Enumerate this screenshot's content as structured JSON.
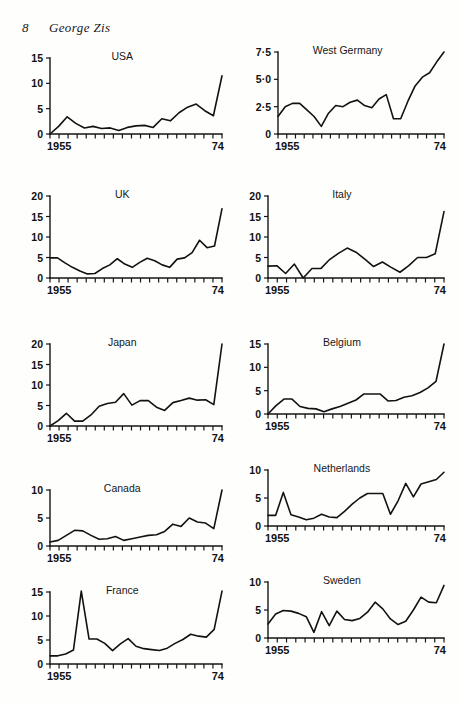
{
  "page": {
    "folio": "8",
    "running_head": "George Zis",
    "background_color": "#fefefd",
    "ink_color": "#121212"
  },
  "chart_data": [
    {
      "id": "usa",
      "type": "line",
      "title": "USA",
      "xlabel": "",
      "ylabel": "",
      "x_start_label": "1955",
      "x_end_label": "74",
      "x": [
        1955,
        1956,
        1957,
        1958,
        1959,
        1960,
        1961,
        1962,
        1963,
        1964,
        1965,
        1966,
        1967,
        1968,
        1969,
        1970,
        1971,
        1972,
        1973,
        1974
      ],
      "xlim": [
        1955,
        1974
      ],
      "ylim": [
        0,
        15
      ],
      "yticks": [
        0,
        5,
        10,
        15
      ],
      "ytick_labels": [
        "0",
        "5",
        "10",
        "15"
      ],
      "grid": false,
      "values": [
        0.0,
        1.5,
        3.4,
        2.1,
        1.2,
        1.5,
        1.1,
        1.2,
        0.7,
        1.3,
        1.6,
        1.7,
        1.3,
        3.0,
        2.6,
        4.2,
        5.3,
        5.9,
        4.6,
        3.6,
        11.5
      ]
    },
    {
      "id": "west-germany",
      "type": "line",
      "title": "West Germany",
      "xlabel": "",
      "ylabel": "",
      "x_start_label": "1955",
      "x_end_label": "74",
      "x": [
        1955,
        1956,
        1957,
        1958,
        1959,
        1960,
        1961,
        1962,
        1963,
        1964,
        1965,
        1966,
        1967,
        1968,
        1969,
        1970,
        1971,
        1972,
        1973,
        1974
      ],
      "xlim": [
        1955,
        1974
      ],
      "ylim": [
        0,
        7.5
      ],
      "yticks": [
        0,
        2.5,
        5.0,
        7.5
      ],
      "ytick_labels": [
        "0",
        "2·5",
        "5·0",
        "7·5"
      ],
      "grid": false,
      "values": [
        1.6,
        2.5,
        2.8,
        2.8,
        2.2,
        1.6,
        0.7,
        1.9,
        2.6,
        2.5,
        2.9,
        3.1,
        2.6,
        2.4,
        3.2,
        3.6,
        1.4,
        1.4,
        3.0,
        4.4,
        5.2,
        5.6,
        6.6,
        7.5
      ]
    },
    {
      "id": "uk",
      "type": "line",
      "title": "UK",
      "xlabel": "",
      "ylabel": "",
      "x_start_label": "1955",
      "x_end_label": "74",
      "x": [
        1955,
        1956,
        1957,
        1958,
        1959,
        1960,
        1961,
        1962,
        1963,
        1964,
        1965,
        1966,
        1967,
        1968,
        1969,
        1970,
        1971,
        1972,
        1973,
        1974
      ],
      "xlim": [
        1955,
        1974
      ],
      "ylim": [
        0,
        20
      ],
      "yticks": [
        0,
        5,
        10,
        15,
        20
      ],
      "ytick_labels": [
        "0",
        "5",
        "10",
        "15",
        "20"
      ],
      "grid": false,
      "values": [
        4.9,
        4.9,
        3.7,
        2.6,
        1.7,
        1.0,
        1.1,
        2.3,
        3.2,
        4.7,
        3.4,
        2.6,
        3.8,
        4.8,
        4.2,
        3.2,
        2.6,
        4.6,
        4.9,
        6.2,
        9.2,
        7.4,
        7.8,
        16.9
      ]
    },
    {
      "id": "italy",
      "type": "line",
      "title": "Italy",
      "xlabel": "",
      "ylabel": "",
      "x_start_label": "1955",
      "x_end_label": "74",
      "x": [
        1955,
        1956,
        1957,
        1958,
        1959,
        1960,
        1961,
        1962,
        1963,
        1964,
        1965,
        1966,
        1967,
        1968,
        1969,
        1970,
        1971,
        1972,
        1973,
        1974
      ],
      "xlim": [
        1955,
        1974
      ],
      "ylim": [
        0,
        20
      ],
      "yticks": [
        0,
        5,
        10,
        15,
        20
      ],
      "ytick_labels": [
        "0",
        "5",
        "10",
        "15",
        "20"
      ],
      "grid": false,
      "values": [
        2.9,
        3.0,
        1.1,
        3.4,
        0.0,
        2.3,
        2.3,
        4.5,
        6.0,
        7.3,
        6.3,
        4.6,
        2.8,
        3.9,
        2.6,
        1.4,
        3.0,
        5.0,
        5.0,
        5.9,
        16.2
      ]
    },
    {
      "id": "japan",
      "type": "line",
      "title": "Japan",
      "xlabel": "",
      "ylabel": "",
      "x_start_label": "1955",
      "x_end_label": "74",
      "x": [
        1955,
        1956,
        1957,
        1958,
        1959,
        1960,
        1961,
        1962,
        1963,
        1964,
        1965,
        1966,
        1967,
        1968,
        1969,
        1970,
        1971,
        1972,
        1973,
        1974
      ],
      "xlim": [
        1955,
        1974
      ],
      "ylim": [
        0,
        20
      ],
      "yticks": [
        0,
        5,
        10,
        15,
        20
      ],
      "ytick_labels": [
        "0",
        "5",
        "10",
        "15",
        "20"
      ],
      "grid": false,
      "values": [
        0.0,
        1.3,
        3.1,
        1.2,
        1.2,
        2.7,
        4.8,
        5.5,
        5.8,
        7.9,
        5.1,
        6.2,
        6.2,
        4.6,
        3.8,
        5.7,
        6.2,
        6.8,
        6.3,
        6.4,
        5.2,
        20.0
      ]
    },
    {
      "id": "belgium",
      "type": "line",
      "title": "Belgium",
      "xlabel": "",
      "ylabel": "",
      "x_start_label": "1955",
      "x_end_label": "74",
      "x": [
        1955,
        1956,
        1957,
        1958,
        1959,
        1960,
        1961,
        1962,
        1963,
        1964,
        1965,
        1966,
        1967,
        1968,
        1969,
        1970,
        1971,
        1972,
        1973,
        1974
      ],
      "xlim": [
        1955,
        1974
      ],
      "ylim": [
        0,
        15
      ],
      "yticks": [
        0,
        5,
        10,
        15
      ],
      "ytick_labels": [
        "0",
        "5",
        "10",
        "15"
      ],
      "grid": false,
      "values": [
        0.0,
        1.8,
        3.2,
        3.2,
        1.6,
        1.2,
        1.1,
        0.5,
        1.1,
        1.6,
        2.3,
        3.0,
        4.3,
        4.3,
        4.3,
        2.8,
        2.9,
        3.6,
        3.9,
        4.6,
        5.6,
        7.0,
        15.0
      ]
    },
    {
      "id": "canada",
      "type": "line",
      "title": "Canada",
      "xlabel": "",
      "ylabel": "",
      "x_start_label": "1955",
      "x_end_label": "74",
      "x": [
        1955,
        1956,
        1957,
        1958,
        1959,
        1960,
        1961,
        1962,
        1963,
        1964,
        1965,
        1966,
        1967,
        1968,
        1969,
        1970,
        1971,
        1972,
        1973,
        1974
      ],
      "xlim": [
        1955,
        1974
      ],
      "ylim": [
        0,
        10
      ],
      "yticks": [
        0,
        5,
        10
      ],
      "ytick_labels": [
        "0",
        "5",
        "10"
      ],
      "grid": false,
      "values": [
        0.7,
        1.0,
        1.9,
        2.8,
        2.7,
        1.9,
        1.2,
        1.3,
        1.7,
        1.0,
        1.3,
        1.6,
        1.9,
        2.0,
        2.6,
        3.9,
        3.5,
        5.0,
        4.3,
        4.1,
        3.1,
        10.0
      ]
    },
    {
      "id": "netherlands",
      "type": "line",
      "title": "Netherlands",
      "xlabel": "",
      "ylabel": "",
      "x_start_label": "1955",
      "x_end_label": "74",
      "x": [
        1955,
        1956,
        1957,
        1958,
        1959,
        1960,
        1961,
        1962,
        1963,
        1964,
        1965,
        1966,
        1967,
        1968,
        1969,
        1970,
        1971,
        1972,
        1973,
        1974
      ],
      "xlim": [
        1955,
        1974
      ],
      "ylim": [
        0,
        10
      ],
      "yticks": [
        0,
        5,
        10
      ],
      "ytick_labels": [
        "0",
        "5",
        "10"
      ],
      "grid": false,
      "values": [
        1.9,
        1.9,
        6.0,
        2.0,
        1.6,
        1.1,
        1.4,
        2.1,
        1.6,
        1.5,
        2.6,
        3.9,
        5.0,
        5.8,
        5.8,
        5.8,
        2.1,
        4.5,
        7.6,
        5.2,
        7.5,
        7.9,
        8.3,
        9.6
      ]
    },
    {
      "id": "france",
      "type": "line",
      "title": "France",
      "xlabel": "",
      "ylabel": "",
      "x_start_label": "1955",
      "x_end_label": "74",
      "x": [
        1955,
        1956,
        1957,
        1958,
        1959,
        1960,
        1961,
        1962,
        1963,
        1964,
        1965,
        1966,
        1967,
        1968,
        1969,
        1970,
        1971,
        1972,
        1973,
        1974
      ],
      "xlim": [
        1955,
        1974
      ],
      "ylim": [
        0,
        15
      ],
      "yticks": [
        0,
        5,
        10,
        15
      ],
      "ytick_labels": [
        "0",
        "5",
        "10",
        "15"
      ],
      "grid": false,
      "values": [
        1.7,
        1.7,
        2.1,
        2.9,
        15.2,
        5.2,
        5.2,
        4.3,
        2.8,
        4.2,
        5.3,
        3.7,
        3.2,
        3.0,
        2.8,
        3.3,
        4.3,
        5.1,
        6.2,
        5.8,
        5.6,
        7.2,
        15.2
      ]
    },
    {
      "id": "sweden",
      "type": "line",
      "title": "Sweden",
      "xlabel": "",
      "ylabel": "",
      "x_start_label": "1955",
      "x_end_label": "74",
      "x": [
        1955,
        1956,
        1957,
        1958,
        1959,
        1960,
        1961,
        1962,
        1963,
        1964,
        1965,
        1966,
        1967,
        1968,
        1969,
        1970,
        1971,
        1972,
        1973,
        1974
      ],
      "xlim": [
        1955,
        1974
      ],
      "ylim": [
        0,
        10
      ],
      "yticks": [
        0,
        5,
        10
      ],
      "ytick_labels": [
        "0",
        "5",
        "10"
      ],
      "grid": false,
      "values": [
        2.5,
        4.3,
        4.9,
        4.8,
        4.4,
        3.8,
        1.0,
        4.7,
        2.2,
        4.8,
        3.3,
        3.1,
        3.5,
        4.6,
        6.4,
        5.2,
        3.4,
        2.4,
        3.0,
        5.0,
        7.3,
        6.4,
        6.3,
        9.4
      ]
    }
  ]
}
